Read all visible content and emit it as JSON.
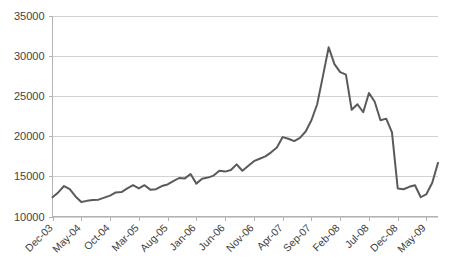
{
  "chart_data": {
    "type": "line",
    "title": "",
    "subtitle": "",
    "xlabel": "",
    "ylabel": "",
    "ylim": [
      10000,
      35000
    ],
    "ytick_values": [
      10000,
      15000,
      20000,
      25000,
      30000,
      35000
    ],
    "ytick_labels": [
      "10000",
      "15000",
      "20000",
      "25000",
      "30000",
      "35000"
    ],
    "grid": "horizontal",
    "legend": "none",
    "legend_position": "none",
    "line_color": "#5a5a5a",
    "gridline_color": "#d2d2d2",
    "background_color": "#ffffff",
    "xtick_labels": [
      "Dec-03",
      "May-04",
      "Oct-04",
      "Mar-05",
      "Aug-05",
      "Jan-06",
      "Jun-06",
      "Nov-06",
      "Apr-07",
      "Sep-07",
      "Feb-08",
      "Jul-08",
      "Dec-08",
      "May-09"
    ],
    "xtick_interval_months": 5,
    "x": [
      "Dec-03",
      "Jan-04",
      "Feb-04",
      "Mar-04",
      "Apr-04",
      "May-04",
      "Jun-04",
      "Jul-04",
      "Aug-04",
      "Sep-04",
      "Oct-04",
      "Nov-04",
      "Dec-04",
      "Jan-05",
      "Feb-05",
      "Mar-05",
      "Apr-05",
      "May-05",
      "Jun-05",
      "Jul-05",
      "Aug-05",
      "Sep-05",
      "Oct-05",
      "Nov-05",
      "Dec-05",
      "Jan-06",
      "Feb-06",
      "Mar-06",
      "Apr-06",
      "May-06",
      "Jun-06",
      "Jul-06",
      "Aug-06",
      "Sep-06",
      "Oct-06",
      "Nov-06",
      "Dec-06",
      "Jan-07",
      "Feb-07",
      "Mar-07",
      "Apr-07",
      "May-07",
      "Jun-07",
      "Jul-07",
      "Aug-07",
      "Sep-07",
      "Oct-07",
      "Nov-07",
      "Dec-07",
      "Jan-08",
      "Feb-08",
      "Mar-08",
      "Apr-08",
      "May-08",
      "Jun-08",
      "Jul-08",
      "Aug-08",
      "Sep-08",
      "Oct-08",
      "Nov-08",
      "Dec-08",
      "Jan-09",
      "Feb-09",
      "Mar-09",
      "Apr-09",
      "May-09",
      "Jun-09",
      "Jul-09"
    ],
    "values": [
      12400,
      13000,
      13800,
      13400,
      12500,
      11800,
      11950,
      12050,
      12100,
      12350,
      12600,
      13000,
      13050,
      13500,
      13900,
      13500,
      13900,
      13350,
      13400,
      13800,
      14000,
      14400,
      14800,
      14750,
      15300,
      14100,
      14700,
      14850,
      15100,
      15700,
      15600,
      15800,
      16500,
      15700,
      16300,
      16900,
      17200,
      17500,
      18000,
      18600,
      19900,
      19700,
      19400,
      19800,
      20600,
      22000,
      24000,
      27500,
      31100,
      29000,
      28000,
      27700,
      23300,
      24000,
      23000,
      25400,
      24300,
      22000,
      22200,
      20500,
      13500,
      13400,
      13700,
      13900,
      12400,
      12800,
      14200,
      16700
    ],
    "series": [
      {
        "name": "Index",
        "values": [
          12400,
          13000,
          13800,
          13400,
          12500,
          11800,
          11950,
          12050,
          12100,
          12350,
          12600,
          13000,
          13050,
          13500,
          13900,
          13500,
          13900,
          13350,
          13400,
          13800,
          14000,
          14400,
          14800,
          14750,
          15300,
          14100,
          14700,
          14850,
          15100,
          15700,
          15600,
          15800,
          16500,
          15700,
          16300,
          16900,
          17200,
          17500,
          18000,
          18600,
          19900,
          19700,
          19400,
          19800,
          20600,
          22000,
          24000,
          27500,
          31100,
          29000,
          28000,
          27700,
          23300,
          24000,
          23000,
          25400,
          24300,
          22000,
          22200,
          20500,
          13500,
          13400,
          13700,
          13900,
          12400,
          12800,
          14200,
          16700
        ]
      }
    ]
  }
}
